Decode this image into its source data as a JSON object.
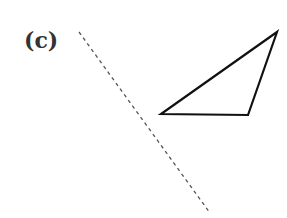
{
  "figure": {
    "label": "(c)",
    "mirror_line": {
      "x1": 79,
      "y1": 32,
      "x2": 210,
      "y2": 213,
      "style": "dashed",
      "color": "#555555"
    },
    "triangle": {
      "points": "277,32 161,114 248,115",
      "stroke": "#111111",
      "fill": "none"
    }
  }
}
